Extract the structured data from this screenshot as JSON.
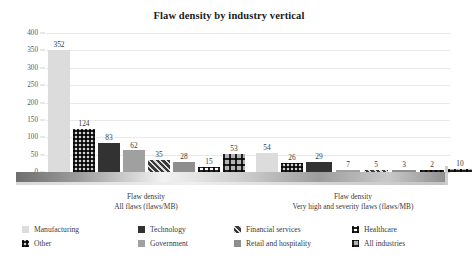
{
  "chart_data": {
    "type": "bar",
    "title": "Flaw density by industry vertical",
    "xlabel": "",
    "ylabel": "",
    "ylim": [
      0,
      400
    ],
    "yticks": [
      400,
      350,
      300,
      250,
      200,
      150,
      100,
      50,
      0
    ],
    "grid": true,
    "legend_position": "bottom",
    "categories": [
      "Flaw density All flaws (flaws/MB)",
      "Flaw density Very high and severity flaws (flaws/MB)"
    ],
    "category_lines": [
      {
        "line1": "Flaw density",
        "line2": "All flaws (flaws/MB)"
      },
      {
        "line1": "Flaw density",
        "line2": "Very high and severity flaws (flaws/MB)"
      }
    ],
    "series": [
      {
        "name": "Manufacturing",
        "pattern": "solid-light-gray",
        "color": "#dcdcdc",
        "values": [
          352,
          54
        ]
      },
      {
        "name": "Other",
        "pattern": "light-with-dark-dots",
        "color": "#d2d2d2",
        "values": [
          124,
          26
        ]
      },
      {
        "name": "Technology",
        "pattern": "solid-near-black",
        "color": "#323232",
        "values": [
          83,
          29
        ]
      },
      {
        "name": "Government",
        "pattern": "solid-medium-gray",
        "color": "#a0a0a0",
        "values": [
          62,
          7
        ]
      },
      {
        "name": "Financial services",
        "pattern": "diagonal-stripes",
        "color": "#3a3a3a",
        "values": [
          35,
          5
        ]
      },
      {
        "name": "Retail and hospitality",
        "pattern": "solid-gray",
        "color": "#8e8e8e",
        "values": [
          28,
          3
        ]
      },
      {
        "name": "Healthcare",
        "pattern": "white-grid-blocks",
        "color": "#ffffff",
        "values": [
          15,
          2
        ]
      },
      {
        "name": "All industries",
        "pattern": "gray-with-dark-dots",
        "color": "#b4b4b4",
        "values": [
          53,
          10
        ]
      }
    ]
  },
  "legend": {
    "columns": [
      [
        "Manufacturing",
        "Other"
      ],
      [
        "Technology",
        "Government"
      ],
      [
        "Financial services",
        "Retail and hospitality"
      ],
      [
        "Healthcare",
        "All industries"
      ]
    ]
  }
}
